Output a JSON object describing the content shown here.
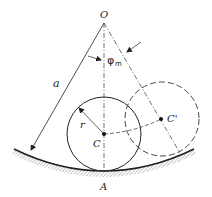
{
  "diagram": {
    "labels": {
      "origin": "O",
      "radius_large": "a",
      "radius_small": "r",
      "center": "C",
      "center_displaced": "C'",
      "contact_point": "A",
      "angle_symbol": "φ",
      "angle_subscript": "m"
    },
    "colors": {
      "line": "#222222",
      "hatch": "#777777",
      "background": "#ffffff"
    }
  }
}
